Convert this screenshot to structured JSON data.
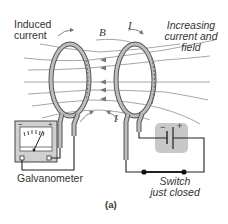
{
  "labels": {
    "induced_current_line1": "Induced",
    "induced_current_line2": "current",
    "b_field": "B",
    "current_top": "I",
    "current_bottom": "I",
    "increasing_line1": "Increasing",
    "increasing_line2": "current and",
    "increasing_line3": "field",
    "galvanometer": "Galvanometer",
    "switch_line1": "Switch",
    "switch_line2": "just closed",
    "panel": "(a)",
    "battery_minus": "−",
    "battery_plus": "+",
    "galv_minus": "−",
    "galv_plus": "+"
  },
  "colors": {
    "coil_fill": "#b5b5b5",
    "coil_outline": "#555555",
    "field_line": "#8a8a8a",
    "wire": "#222222",
    "battery_box": "#c8c8c8",
    "galv_body": "#d0d0d0",
    "text": "#333333"
  },
  "icons": {
    "galvanometer": "galvanometer-icon",
    "battery": "battery-icon",
    "switch": "switch-icon"
  }
}
